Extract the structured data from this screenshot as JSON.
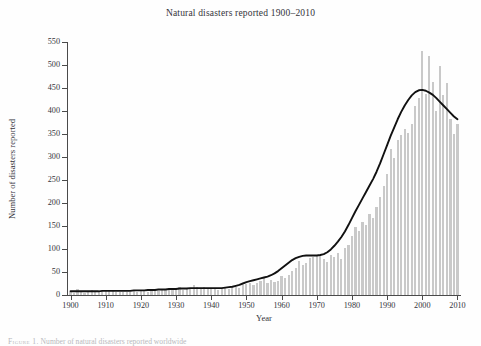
{
  "figure": {
    "title": "Natural disasters reported 1900–2010",
    "background_color": "#fefefe",
    "caption_prefix": "Figure 1.",
    "caption_text": "Number of natural disasters reported worldwide"
  },
  "axes": {
    "ylabel": "Number of disasters reported",
    "xlabel": "Year",
    "y_ticks": [
      "0",
      "50",
      "100",
      "150",
      "200",
      "250",
      "300",
      "350",
      "400",
      "450",
      "500",
      "550"
    ],
    "x_ticks": [
      "1900",
      "1910",
      "1920",
      "1930",
      "1940",
      "1950",
      "1960",
      "1970",
      "1980",
      "1990",
      "2000",
      "2010"
    ]
  },
  "colors": {
    "bar": "#c9c9c9",
    "trend_line": "#111111",
    "axis": "#4a4a4a",
    "text": "#33333a"
  },
  "chart_data": {
    "type": "bar",
    "title": "Natural disasters reported 1900–2010",
    "xlabel": "Year",
    "ylabel": "Number of disasters reported",
    "xlim": [
      1899,
      2011
    ],
    "ylim": [
      0,
      550
    ],
    "y_tick_step": 50,
    "x_tick_step": 10,
    "grid": false,
    "legend": false,
    "x": [
      1900,
      1901,
      1902,
      1903,
      1904,
      1905,
      1906,
      1907,
      1908,
      1909,
      1910,
      1911,
      1912,
      1913,
      1914,
      1915,
      1916,
      1917,
      1918,
      1919,
      1920,
      1921,
      1922,
      1923,
      1924,
      1925,
      1926,
      1927,
      1928,
      1929,
      1930,
      1931,
      1932,
      1933,
      1934,
      1935,
      1936,
      1937,
      1938,
      1939,
      1940,
      1941,
      1942,
      1943,
      1944,
      1945,
      1946,
      1947,
      1948,
      1949,
      1950,
      1951,
      1952,
      1953,
      1954,
      1955,
      1956,
      1957,
      1958,
      1959,
      1960,
      1961,
      1962,
      1963,
      1964,
      1965,
      1966,
      1967,
      1968,
      1969,
      1970,
      1971,
      1972,
      1973,
      1974,
      1975,
      1976,
      1977,
      1978,
      1979,
      1980,
      1981,
      1982,
      1983,
      1984,
      1985,
      1986,
      1987,
      1988,
      1989,
      1990,
      1991,
      1992,
      1993,
      1994,
      1995,
      1996,
      1997,
      1998,
      1999,
      2000,
      2001,
      2002,
      2003,
      2004,
      2005,
      2006,
      2007,
      2008,
      2009,
      2010
    ],
    "series": [
      {
        "name": "Disasters reported",
        "type": "bar",
        "values": [
          6,
          5,
          12,
          6,
          4,
          8,
          10,
          8,
          7,
          9,
          8,
          9,
          8,
          7,
          6,
          7,
          6,
          6,
          9,
          7,
          10,
          9,
          7,
          12,
          8,
          9,
          11,
          14,
          10,
          12,
          13,
          18,
          11,
          12,
          16,
          22,
          18,
          14,
          17,
          13,
          14,
          12,
          11,
          13,
          15,
          14,
          17,
          18,
          16,
          21,
          24,
          27,
          22,
          26,
          31,
          38,
          26,
          33,
          29,
          31,
          42,
          38,
          44,
          52,
          58,
          74,
          66,
          70,
          80,
          82,
          88,
          86,
          78,
          72,
          88,
          82,
          92,
          78,
          102,
          108,
          128,
          148,
          140,
          158,
          152,
          176,
          168,
          192,
          212,
          238,
          262,
          318,
          298,
          336,
          348,
          360,
          352,
          372,
          410,
          428,
          530,
          438,
          520,
          462,
          400,
          498,
          434,
          460,
          382,
          350,
          372
        ]
      },
      {
        "name": "Smoothed trend (LOESS)",
        "type": "line",
        "values": [
          8,
          8,
          8,
          8,
          8,
          8,
          8,
          8,
          8,
          9,
          9,
          9,
          9,
          9,
          9,
          9,
          9,
          9,
          10,
          10,
          10,
          10,
          11,
          11,
          11,
          12,
          12,
          12,
          13,
          13,
          13,
          14,
          14,
          14,
          15,
          15,
          15,
          15,
          15,
          15,
          15,
          15,
          15,
          15,
          16,
          17,
          18,
          20,
          22,
          25,
          28,
          30,
          32,
          34,
          36,
          38,
          40,
          43,
          47,
          52,
          58,
          64,
          70,
          76,
          80,
          83,
          85,
          86,
          86,
          86,
          86,
          87,
          89,
          93,
          99,
          107,
          116,
          126,
          138,
          152,
          167,
          182,
          196,
          210,
          224,
          238,
          252,
          268,
          286,
          306,
          326,
          346,
          364,
          382,
          398,
          412,
          424,
          434,
          441,
          445,
          446,
          444,
          440,
          435,
          428,
          420,
          412,
          404,
          396,
          388,
          382
        ]
      }
    ],
    "notes": {
      "peak_bar": {
        "year": 2000,
        "value": 530
      },
      "trend_peak": {
        "year": 2001,
        "value": 446
      },
      "plateau": {
        "years": "1966–1972",
        "approx_value": 86
      }
    }
  }
}
